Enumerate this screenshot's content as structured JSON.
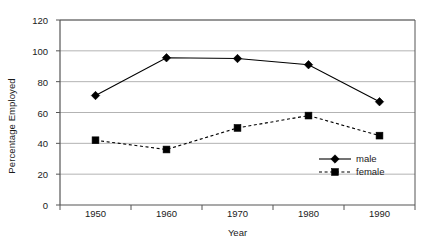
{
  "chart_data": {
    "type": "line",
    "title": "",
    "xlabel": "Year",
    "ylabel": "Percentage Employed",
    "categories": [
      "1950",
      "1960",
      "1970",
      "1980",
      "1990"
    ],
    "series": [
      {
        "name": "male",
        "values": [
          71,
          95.5,
          95,
          91,
          67
        ],
        "marker": "diamond",
        "linestyle": "solid",
        "color": "#000000"
      },
      {
        "name": "female",
        "values": [
          42,
          36,
          50,
          58,
          45
        ],
        "marker": "square",
        "linestyle": "dashed",
        "color": "#000000"
      }
    ],
    "ylim": [
      0,
      120
    ],
    "yticks": [
      0,
      20,
      40,
      60,
      80,
      100,
      120
    ],
    "ytick_labels": [
      "0",
      "20",
      "40",
      "60",
      "80",
      "100",
      "120"
    ],
    "grid": "horizontal",
    "grid_color": "#b3b3b3",
    "axis_color": "#555555",
    "legend_position": "inside-bottom-right",
    "background": "#ffffff"
  },
  "legend": {
    "entries": [
      {
        "label": "male"
      },
      {
        "label": "female"
      }
    ]
  },
  "axes": {
    "y_title": "Percentage Employed",
    "x_title": "Year"
  }
}
